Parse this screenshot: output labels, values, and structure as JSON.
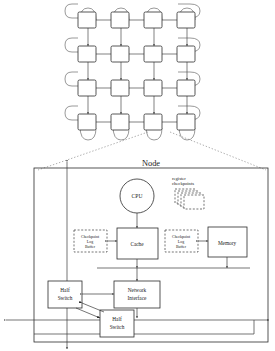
{
  "figure": {
    "title_label": "Node",
    "torus": {
      "rows": 4,
      "cols": 4,
      "wraparound": "true"
    }
  },
  "node": {
    "label": "Node",
    "cpu": {
      "label": "CPU",
      "shape": "circle"
    },
    "register_checkpoints": {
      "line1": "register",
      "line2": "checkpoints",
      "stack_count": 4
    },
    "cache": {
      "label": "Cache"
    },
    "memory": {
      "label": "Memory"
    },
    "checkpoint_log_buffer_left": {
      "line1": "Checkpoint",
      "line2": "Log",
      "line3": "Buffer"
    },
    "checkpoint_log_buffer_right": {
      "line1": "Checkpoint",
      "line2": "Log",
      "line3": "Buffer"
    },
    "network_interface": {
      "line1": "Network",
      "line2": "Interface"
    },
    "half_switch_upper": {
      "line1": "Half",
      "line2": "Switch"
    },
    "half_switch_lower": {
      "line1": "Half",
      "line2": "Switch"
    }
  },
  "colors": {
    "ink": "#1a1a1a",
    "line": "#3a3a3a",
    "arc": "#6d6d6d",
    "dotted": "#8c8c8c",
    "paper": "#ffffff"
  }
}
